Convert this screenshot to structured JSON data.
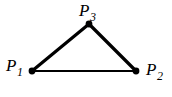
{
  "figure": {
    "kind": "triangle-diagram",
    "background_color": "#ffffff",
    "stroke_color": "#000000",
    "width": 172,
    "height": 97,
    "vertices": [
      {
        "id": "P1",
        "label_base": "P",
        "label_subscript": "1",
        "x": 32,
        "y": 71,
        "dot_radius": 3.4
      },
      {
        "id": "P2",
        "label_base": "P",
        "label_subscript": "2",
        "x": 136,
        "y": 71,
        "dot_radius": 3.4
      },
      {
        "id": "P3",
        "label_base": "P",
        "label_subscript": "3",
        "x": 89,
        "y": 24,
        "dot_radius": 3.4
      }
    ],
    "edges": [
      {
        "id": "edge-p1-p3",
        "from": "P1",
        "to": "P3",
        "stroke_width": 3.2
      },
      {
        "id": "edge-p3-p2",
        "from": "P3",
        "to": "P2",
        "stroke_width": 3.2
      },
      {
        "id": "edge-p1-p2",
        "from": "P1",
        "to": "P2",
        "stroke_width": 2.2
      }
    ]
  }
}
